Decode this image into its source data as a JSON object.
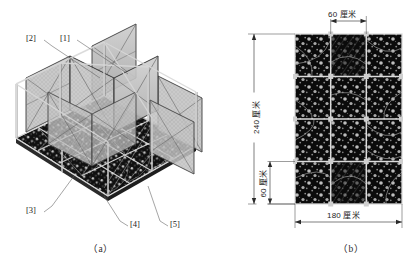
{
  "figure": {
    "panel_a": {
      "caption": "（a）",
      "callouts": [
        {
          "id": "callout-1",
          "label": "[1]"
        },
        {
          "id": "callout-2",
          "label": "[2]"
        },
        {
          "id": "callout-3",
          "label": "[3]"
        },
        {
          "id": "callout-4",
          "label": "[4]"
        },
        {
          "id": "callout-5",
          "label": "[5]"
        }
      ],
      "view": "isometric-3d-modular-grid-assembly",
      "grid_columns": 4,
      "grid_rows": 4,
      "colors": {
        "frame": "#d9d9d9",
        "frame_edge": "#4a4a4a",
        "panel_fill": "#b9b9b9",
        "floor_dark": "#111111",
        "speckle": "#c9c9c9"
      }
    },
    "panel_b": {
      "caption": "（b）",
      "view": "top-plan-tile-layout",
      "grid_columns": 3,
      "grid_rows": 4,
      "dimensions": {
        "top_module_width": "60 厘米",
        "overall_height": "240 厘米",
        "left_module_height": "60 厘米",
        "overall_width": "180 厘米"
      },
      "colors": {
        "tile_dark": "#0d0d0d",
        "grout": "#d6d6d6",
        "speckle": "#b5b5b5",
        "arc": "#8f8f8f"
      }
    }
  }
}
